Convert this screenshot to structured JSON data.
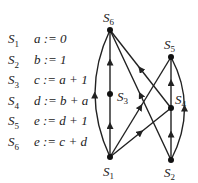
{
  "statements": [
    {
      "id": "S1",
      "name": "S",
      "sub": "1",
      "code": "a := 0"
    },
    {
      "id": "S2",
      "name": "S",
      "sub": "2",
      "code": "b := 1"
    },
    {
      "id": "S3",
      "name": "S",
      "sub": "3",
      "code": "c := a + 1"
    },
    {
      "id": "S4",
      "name": "S",
      "sub": "4",
      "code": "d := b + a"
    },
    {
      "id": "S5",
      "name": "S",
      "sub": "5",
      "code": "e := d + 1"
    },
    {
      "id": "S6",
      "name": "S",
      "sub": "6",
      "code": "e := c + d"
    }
  ],
  "graph": {
    "nodes": [
      {
        "id": "S1",
        "name": "S",
        "sub": "1"
      },
      {
        "id": "S2",
        "name": "S",
        "sub": "2"
      },
      {
        "id": "S3",
        "name": "S",
        "sub": "3"
      },
      {
        "id": "S4",
        "name": "S",
        "sub": "4"
      },
      {
        "id": "S5",
        "name": "S",
        "sub": "5"
      },
      {
        "id": "S6",
        "name": "S",
        "sub": "6"
      }
    ],
    "edges": [
      [
        "S1",
        "S3"
      ],
      [
        "S3",
        "S6"
      ],
      [
        "S1",
        "S6"
      ],
      [
        "S1",
        "S5"
      ],
      [
        "S1",
        "S4"
      ],
      [
        "S2",
        "S6"
      ],
      [
        "S4",
        "S6"
      ],
      [
        "S2",
        "S4"
      ],
      [
        "S4",
        "S5"
      ],
      [
        "S2",
        "S5"
      ]
    ],
    "colors": {
      "line": "#222222",
      "node": "#111111"
    }
  }
}
